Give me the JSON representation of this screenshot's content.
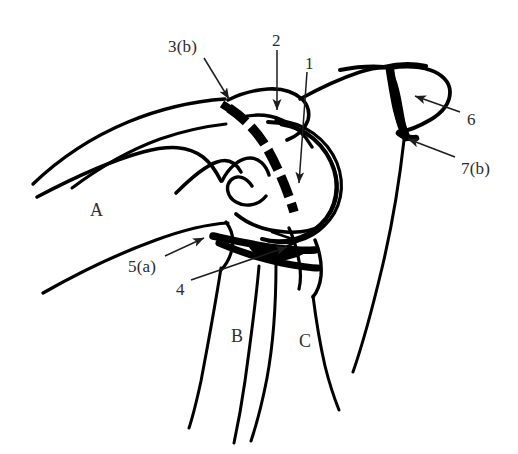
{
  "figure": {
    "type": "anatomical-line-drawing",
    "background_color": "#ffffff",
    "ink_color": "#000000",
    "label_color": "#2b2b2b",
    "width": 518,
    "height": 454
  },
  "callouts": [
    {
      "id": "3b",
      "label": "3(b)",
      "label_x": 168,
      "label_y": 38,
      "leader_from": [
        204,
        58
      ],
      "leader_to": [
        229,
        99
      ],
      "arrow": "down-right"
    },
    {
      "id": "2",
      "label": "2",
      "label_x": 272,
      "label_y": 32,
      "leader_from": [
        277,
        50
      ],
      "leader_to": [
        277,
        110
      ],
      "arrow": "down"
    },
    {
      "id": "1",
      "label": "1",
      "label_x": 305,
      "label_y": 55,
      "leader_from": [
        307,
        72
      ],
      "leader_to": [
        299,
        183
      ],
      "arrow": "down"
    },
    {
      "id": "6",
      "label": "6",
      "label_x": 467,
      "label_y": 111,
      "leader_from": [
        460,
        112
      ],
      "leader_to": [
        415,
        96
      ],
      "arrow": "up-left"
    },
    {
      "id": "7b",
      "label": "7(b)",
      "label_x": 461,
      "label_y": 160,
      "leader_from": [
        455,
        157
      ],
      "leader_to": [
        408,
        139
      ],
      "arrow": "up-left"
    },
    {
      "id": "5a",
      "label": "5(a)",
      "label_x": 128,
      "label_y": 258,
      "leader_from": [
        165,
        256
      ],
      "leader_to": [
        204,
        238
      ],
      "arrow": "up-right"
    },
    {
      "id": "4",
      "label": "4",
      "label_x": 176,
      "label_y": 281,
      "leader_from": [
        191,
        280
      ],
      "leader_to": [
        287,
        247
      ],
      "arrow": "up-right"
    }
  ],
  "regions": [
    {
      "id": "A",
      "label": "A",
      "x": 90,
      "y": 201
    },
    {
      "id": "B",
      "label": "B",
      "x": 231,
      "y": 327
    },
    {
      "id": "C",
      "label": "C",
      "x": 299,
      "y": 332
    }
  ]
}
